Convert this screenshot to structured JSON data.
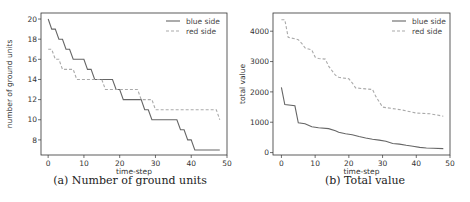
{
  "chart_data": [
    {
      "type": "line",
      "id": "a",
      "caption": "(a) Number of ground units",
      "title": "",
      "xlabel": "time-step",
      "ylabel": "number of ground units",
      "xlim": [
        -2,
        50
      ],
      "ylim": [
        6.5,
        20.6
      ],
      "xticks": [
        0,
        10,
        20,
        30,
        40,
        50
      ],
      "yticks": [
        8,
        10,
        12,
        14,
        16,
        18,
        20
      ],
      "grid": false,
      "legend_position": "upper right",
      "series": [
        {
          "name": "blue side",
          "style": "solid",
          "color": "#666666",
          "x": [
            0,
            1,
            2,
            3,
            4,
            5,
            6,
            7,
            8,
            9,
            10,
            11,
            12,
            13,
            14,
            15,
            16,
            17,
            18,
            19,
            20,
            21,
            22,
            23,
            24,
            25,
            26,
            27,
            28,
            29,
            30,
            31,
            32,
            33,
            34,
            35,
            36,
            37,
            38,
            39,
            40,
            41,
            42,
            43,
            44,
            45,
            46,
            47,
            48
          ],
          "values": [
            20,
            19,
            19,
            18,
            18,
            17,
            17,
            16,
            16,
            16,
            16,
            15,
            15,
            14,
            14,
            14,
            14,
            14,
            14,
            13,
            13,
            12,
            12,
            12,
            12,
            12,
            12,
            11,
            11,
            10,
            10,
            10,
            10,
            10,
            10,
            10,
            10,
            9,
            9,
            8,
            8,
            7,
            7,
            7,
            7,
            7,
            7,
            7,
            7
          ]
        },
        {
          "name": "red side",
          "style": "dashed",
          "color": "#aaaaaa",
          "x": [
            0,
            1,
            2,
            3,
            4,
            5,
            6,
            7,
            8,
            9,
            10,
            11,
            12,
            13,
            14,
            15,
            16,
            17,
            18,
            19,
            20,
            21,
            22,
            23,
            24,
            25,
            26,
            27,
            28,
            29,
            30,
            31,
            32,
            33,
            34,
            35,
            36,
            37,
            38,
            39,
            40,
            41,
            42,
            43,
            44,
            45,
            46,
            47,
            48
          ],
          "values": [
            17,
            17,
            16,
            16,
            15,
            15,
            15,
            15,
            14,
            14,
            14,
            14,
            14,
            14,
            14,
            14,
            13,
            13,
            13,
            13,
            13,
            13,
            13,
            13,
            13,
            13,
            12,
            12,
            12,
            12,
            11,
            11,
            11,
            11,
            11,
            11,
            11,
            11,
            11,
            11,
            11,
            11,
            11,
            11,
            11,
            11,
            11,
            11,
            10
          ]
        }
      ]
    },
    {
      "type": "line",
      "id": "b",
      "caption": "(b) Total value",
      "title": "",
      "xlabel": "time-step",
      "ylabel": "total value",
      "xlim": [
        -2.5,
        50
      ],
      "ylim": [
        -80,
        4600
      ],
      "xticks": [
        0,
        10,
        20,
        30,
        40,
        50
      ],
      "yticks": [
        0,
        1000,
        2000,
        3000,
        4000
      ],
      "grid": false,
      "legend_position": "upper right",
      "series": [
        {
          "name": "blue side",
          "style": "solid",
          "color": "#666666",
          "x": [
            0,
            1,
            4,
            5,
            7,
            9,
            11,
            14,
            16,
            17,
            19,
            21,
            23,
            25,
            27,
            29,
            31,
            33,
            35,
            37,
            39,
            41,
            43,
            45,
            48
          ],
          "values": [
            2150,
            1580,
            1540,
            980,
            950,
            850,
            820,
            790,
            720,
            670,
            620,
            590,
            530,
            480,
            440,
            410,
            370,
            300,
            280,
            240,
            210,
            170,
            150,
            140,
            130
          ]
        },
        {
          "name": "red side",
          "style": "dashed",
          "color": "#aaaaaa",
          "x": [
            0,
            1,
            2,
            4,
            5,
            6,
            7,
            9,
            10,
            11,
            13,
            14,
            16,
            17,
            20,
            21,
            22,
            25,
            27,
            28,
            30,
            33,
            36,
            40,
            44,
            48
          ],
          "values": [
            4380,
            4380,
            3800,
            3750,
            3720,
            3600,
            3450,
            3380,
            3150,
            3100,
            3080,
            2850,
            2550,
            2480,
            2430,
            2300,
            2130,
            2100,
            2080,
            1850,
            1500,
            1450,
            1400,
            1300,
            1280,
            1200
          ]
        }
      ]
    }
  ]
}
